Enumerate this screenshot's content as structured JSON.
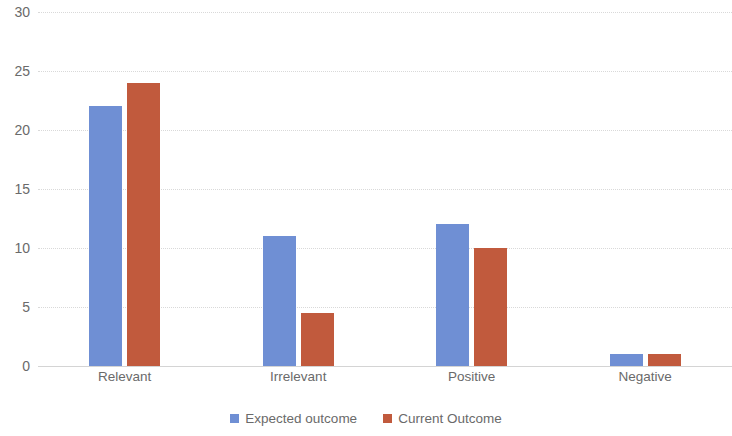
{
  "chart_data": {
    "type": "bar",
    "title": "",
    "subtitle": "",
    "xlabel": "",
    "ylabel": "",
    "categories": [
      "Relevant",
      "Irrelevant",
      "Positive",
      "Negative"
    ],
    "series": [
      {
        "name": "Expected outcome",
        "color": "#6f8fd4",
        "values": [
          22,
          11,
          12,
          1
        ]
      },
      {
        "name": "Current Outcome",
        "color": "#c15a3d",
        "values": [
          24,
          4.5,
          10,
          1
        ]
      }
    ],
    "ylim": [
      0,
      30
    ],
    "ytick_values": [
      0,
      5,
      10,
      15,
      20,
      25,
      30
    ],
    "ytick_labels": [
      "0",
      "5",
      "10",
      "15",
      "20",
      "25",
      "30"
    ],
    "grid": true,
    "grid_axis": "y",
    "legend_position": "bottom",
    "background_color": "#ffffff",
    "axis_text_color": "#6a6a6a",
    "gridline_color": "#d9d9d9"
  }
}
